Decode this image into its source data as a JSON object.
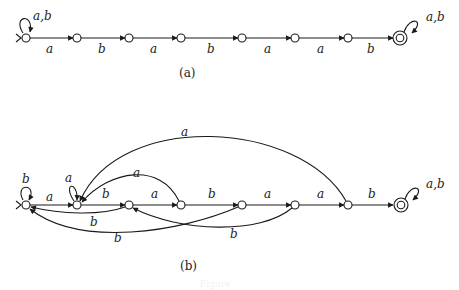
{
  "diagram_a": {
    "caption": "(a)",
    "start_loop_label": "a,b",
    "final_loop_label": "a,b",
    "edges": [
      "a",
      "b",
      "a",
      "b",
      "a",
      "a",
      "b"
    ]
  },
  "diagram_b": {
    "caption": "(b)",
    "start_loop_label": "b",
    "q1_loop_label": "a",
    "final_loop_label": "a,b",
    "forward_edges": [
      "a",
      "b",
      "a",
      "b",
      "a",
      "a",
      "b"
    ],
    "back_edges": [
      {
        "from": "q2",
        "to": "q0",
        "label": "b"
      },
      {
        "from": "q3",
        "to": "q1",
        "label": "a"
      },
      {
        "from": "q4",
        "to": "q0",
        "label": "b"
      },
      {
        "from": "q5",
        "to": "q2",
        "label": "b"
      },
      {
        "from": "q6",
        "to": "q1",
        "label": "a"
      }
    ]
  },
  "figure_caption": "Figure"
}
